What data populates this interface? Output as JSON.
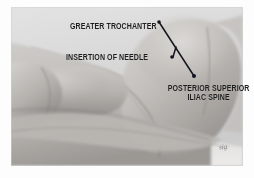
{
  "figure": {
    "kind": "medical-illustration",
    "view": "lateral",
    "signature": "sig"
  },
  "frame": {
    "background_color": "#ffffff",
    "plate_background_color": "#b9b9b9",
    "plate_x": 11,
    "plate_y": 7,
    "plate_width": 232,
    "plate_height": 159
  },
  "annotations": {
    "text_color": "#1d1d1d",
    "leader_color": "#14141e",
    "labels": [
      {
        "id": "greater-trochanter",
        "line1": "GREATER TROCHANTER",
        "line2": "",
        "align": "left",
        "x": 70,
        "y": 22
      },
      {
        "id": "insertion-of-needle",
        "line1": "INSERTION OF NEEDLE",
        "line2": "",
        "align": "left",
        "x": 66,
        "y": 53
      },
      {
        "id": "posterior-superior-iliac-spine",
        "line1": "POSTERIOR SUPERIOR",
        "line2": "ILIAC SPINE",
        "align": "center",
        "x": 201,
        "y": 84
      }
    ],
    "leaders": [
      {
        "id": "leader-main-diagonal",
        "from": "greater-trochanter-tip",
        "x1": 159,
        "y1": 22,
        "x2": 194,
        "y2": 76
      },
      {
        "id": "leader-needle-branch",
        "from": "insertion-of-needle-tip",
        "x1": 173,
        "y1": 57,
        "x2": 176,
        "y2": 47
      }
    ],
    "arrow_tips": [
      {
        "id": "tip-greater-trochanter",
        "x": 159,
        "y": 22
      },
      {
        "id": "tip-insertion-of-needle",
        "x": 172,
        "y": 57
      },
      {
        "id": "tip-posterior-superior-iliac-spine",
        "x": 194,
        "y": 76
      }
    ]
  }
}
